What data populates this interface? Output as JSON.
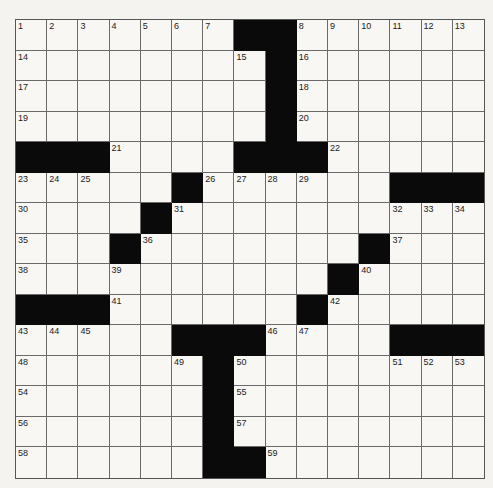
{
  "puzzle": {
    "rows": 15,
    "cols": 15,
    "layout": [
      "#######..######",
      "...............",
      "...............",
      "...............",
      "...............",
      "...............",
      "...............",
      "...............",
      "...............",
      "...............",
      "...............",
      "...............",
      "...............",
      "...............",
      "..............."
    ],
    "grid": [
      ".......##......",
      "........#......",
      "........#......",
      "........#......",
      "###....###.....",
      ".....#......###",
      "....#..........",
      "...#.......#...",
      "..........#....",
      "###......#.....",
      ".....###....###",
      "......#........",
      "......#........",
      "......#........",
      "......##......."
    ],
    "numbers": [
      {
        "r": 0,
        "c": 0,
        "n": "1"
      },
      {
        "r": 0,
        "c": 1,
        "n": "2"
      },
      {
        "r": 0,
        "c": 2,
        "n": "3"
      },
      {
        "r": 0,
        "c": 3,
        "n": "4"
      },
      {
        "r": 0,
        "c": 4,
        "n": "5"
      },
      {
        "r": 0,
        "c": 5,
        "n": "6"
      },
      {
        "r": 0,
        "c": 6,
        "n": "7"
      },
      {
        "r": 0,
        "c": 9,
        "n": "8"
      },
      {
        "r": 0,
        "c": 10,
        "n": "9"
      },
      {
        "r": 0,
        "c": 11,
        "n": "10"
      },
      {
        "r": 0,
        "c": 12,
        "n": "11"
      },
      {
        "r": 0,
        "c": 13,
        "n": "12"
      },
      {
        "r": 0,
        "c": 14,
        "n": "13"
      },
      {
        "r": 1,
        "c": 0,
        "n": "14"
      },
      {
        "r": 1,
        "c": 7,
        "n": "15"
      },
      {
        "r": 1,
        "c": 9,
        "n": "16"
      },
      {
        "r": 2,
        "c": 0,
        "n": "17"
      },
      {
        "r": 2,
        "c": 9,
        "n": "18"
      },
      {
        "r": 3,
        "c": 0,
        "n": "19"
      },
      {
        "r": 3,
        "c": 9,
        "n": "20"
      },
      {
        "r": 4,
        "c": 3,
        "n": "21"
      },
      {
        "r": 4,
        "c": 10,
        "n": "22"
      },
      {
        "r": 5,
        "c": 0,
        "n": "23"
      },
      {
        "r": 5,
        "c": 1,
        "n": "24"
      },
      {
        "r": 5,
        "c": 2,
        "n": "25"
      },
      {
        "r": 5,
        "c": 6,
        "n": "26"
      },
      {
        "r": 5,
        "c": 7,
        "n": "27"
      },
      {
        "r": 5,
        "c": 8,
        "n": "28"
      },
      {
        "r": 5,
        "c": 9,
        "n": "29"
      },
      {
        "r": 6,
        "c": 0,
        "n": "30"
      },
      {
        "r": 6,
        "c": 5,
        "n": "31"
      },
      {
        "r": 6,
        "c": 12,
        "n": "32"
      },
      {
        "r": 6,
        "c": 13,
        "n": "33"
      },
      {
        "r": 6,
        "c": 14,
        "n": "34"
      },
      {
        "r": 7,
        "c": 0,
        "n": "35"
      },
      {
        "r": 7,
        "c": 4,
        "n": "36"
      },
      {
        "r": 7,
        "c": 12,
        "n": "37"
      },
      {
        "r": 8,
        "c": 0,
        "n": "38"
      },
      {
        "r": 8,
        "c": 3,
        "n": "39"
      },
      {
        "r": 8,
        "c": 11,
        "n": "40"
      },
      {
        "r": 9,
        "c": 3,
        "n": "41"
      },
      {
        "r": 9,
        "c": 10,
        "n": "42"
      },
      {
        "r": 10,
        "c": 0,
        "n": "43"
      },
      {
        "r": 10,
        "c": 1,
        "n": "44"
      },
      {
        "r": 10,
        "c": 2,
        "n": "45"
      },
      {
        "r": 10,
        "c": 8,
        "n": "46"
      },
      {
        "r": 10,
        "c": 9,
        "n": "47"
      },
      {
        "r": 11,
        "c": 0,
        "n": "48"
      },
      {
        "r": 11,
        "c": 5,
        "n": "49"
      },
      {
        "r": 11,
        "c": 7,
        "n": "50"
      },
      {
        "r": 11,
        "c": 12,
        "n": "51"
      },
      {
        "r": 11,
        "c": 13,
        "n": "52"
      },
      {
        "r": 11,
        "c": 14,
        "n": "53"
      },
      {
        "r": 12,
        "c": 0,
        "n": "54"
      },
      {
        "r": 12,
        "c": 7,
        "n": "55"
      },
      {
        "r": 13,
        "c": 0,
        "n": "56"
      },
      {
        "r": 13,
        "c": 7,
        "n": "57"
      },
      {
        "r": 14,
        "c": 0,
        "n": "58"
      },
      {
        "r": 14,
        "c": 8,
        "n": "59"
      }
    ]
  },
  "colors": {
    "black_square": "#0a0a0a",
    "white_square": "#f8f7f3",
    "grid_line": "#6a6a6a"
  }
}
